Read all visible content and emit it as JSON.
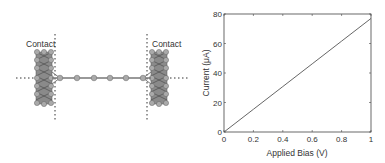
{
  "figure": {
    "left_panel": {
      "description": "molecular junction schematic: atomic chain between two nanotube contacts",
      "labels": {
        "left_contact": "Contact",
        "right_contact": "Contact"
      },
      "chain_atoms": 6
    },
    "right_panel": {
      "title": ""
    }
  },
  "chart_data": {
    "type": "line",
    "title": "",
    "xlabel": "Applied Bias (V)",
    "ylabel": "Current (μA)",
    "xlim": [
      0,
      1
    ],
    "ylim": [
      0,
      80
    ],
    "xticks": [
      "0",
      "0.2",
      "0.4",
      "0.6",
      "0.8",
      "1"
    ],
    "yticks": [
      "0",
      "20",
      "40",
      "60",
      "80"
    ],
    "grid": false,
    "legend": null,
    "series": [
      {
        "name": "I-V",
        "x": [
          0,
          0.2,
          0.4,
          0.6,
          0.8,
          1.0
        ],
        "y": [
          0,
          15.4,
          30.8,
          46.2,
          61.6,
          77
        ]
      }
    ]
  }
}
